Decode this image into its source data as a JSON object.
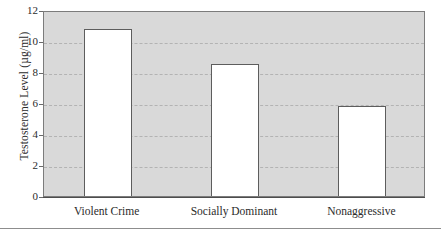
{
  "chart_data": {
    "type": "bar",
    "title": "",
    "xlabel": "",
    "ylabel": "Testosterone Level (µg/ml)",
    "categories": [
      "Violent Crime",
      "Socially Dominant",
      "Nonaggressive"
    ],
    "values": [
      10.75,
      8.5,
      5.8
    ],
    "ylim": [
      0,
      12
    ],
    "ytick_values": [
      0,
      2,
      4,
      6,
      8,
      10,
      12
    ],
    "ytick_labels": [
      "0",
      "2",
      "4",
      "6",
      "8",
      "10",
      "12"
    ],
    "grid": true,
    "grid_style": "dashed",
    "legend": "none",
    "bar_fill_color": "#ffffff",
    "bar_edge_color": "#5d5d5d",
    "plot_background_color": "#d9d9d9",
    "gridline_color": "#b3b3b3",
    "axis_color": "#4d4d4d",
    "text_color": "#2b2b2b"
  }
}
